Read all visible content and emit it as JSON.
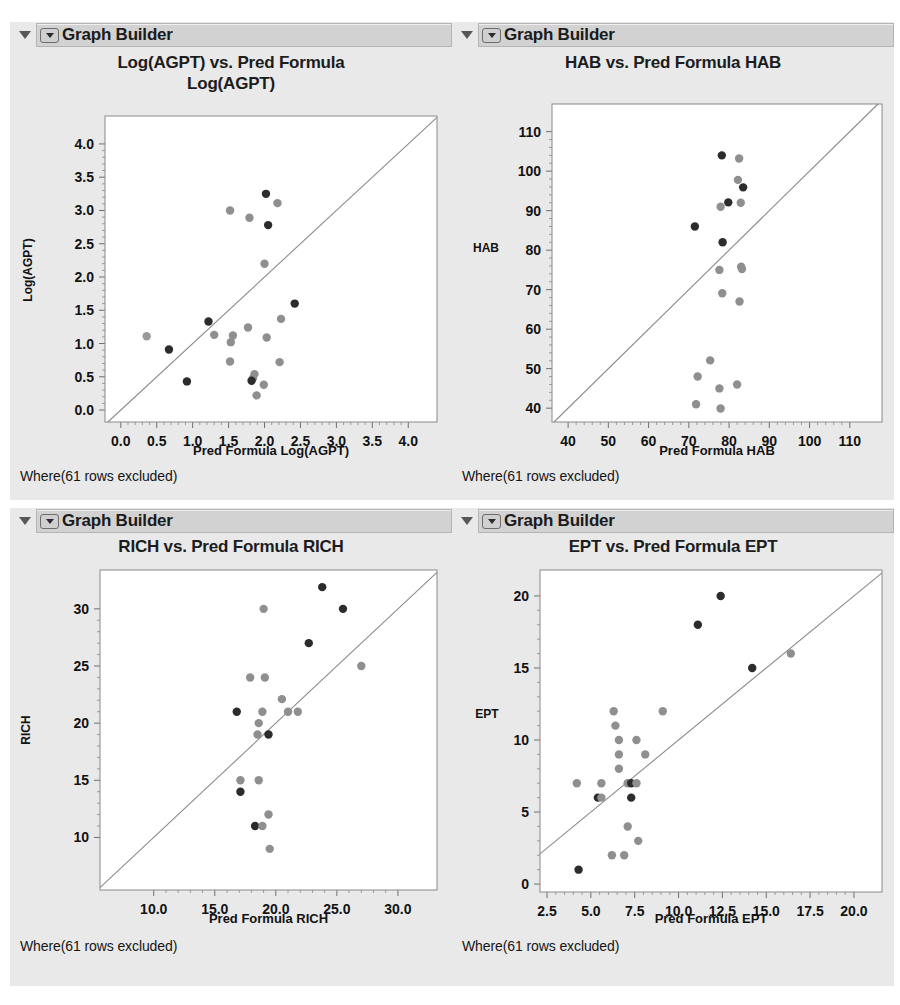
{
  "window": {
    "background": "#ffffff",
    "panel_background": "#e9e9e9",
    "title_bar_background": "#d2d2d2"
  },
  "panels": [
    {
      "id": "agpt",
      "node_title": "Graph Builder",
      "disclosure_icon": "triangle-down-icon",
      "popup_icon": "popup-menu-icon",
      "footer": "Where(61 rows excluded)",
      "chart_title_lines": [
        "Log(AGPT) vs. Pred Formula",
        "Log(AGPT)"
      ]
    },
    {
      "id": "hab",
      "node_title": "Graph Builder",
      "disclosure_icon": "triangle-down-icon",
      "popup_icon": "popup-menu-icon",
      "footer": "Where(61 rows excluded)",
      "chart_title_lines": [
        "HAB vs. Pred Formula HAB"
      ]
    },
    {
      "id": "rich",
      "node_title": "Graph Builder",
      "disclosure_icon": "triangle-down-icon",
      "popup_icon": "popup-menu-icon",
      "footer": "Where(61 rows excluded)",
      "chart_title_lines": [
        "RICH vs. Pred Formula RICH"
      ]
    },
    {
      "id": "ept",
      "node_title": "Graph Builder",
      "disclosure_icon": "triangle-down-icon",
      "popup_icon": "popup-menu-icon",
      "footer": "Where(61 rows excluded)",
      "chart_title_lines": [
        "EPT vs. Pred Formula EPT"
      ]
    }
  ],
  "chart_data": [
    {
      "id": "agpt",
      "type": "scatter",
      "title": "Log(AGPT) vs. Pred Formula Log(AGPT)",
      "xlabel": "Pred Formula Log(AGPT)",
      "ylabel": "Log(AGPT)",
      "xlim": [
        -0.22,
        4.4
      ],
      "ylim": [
        -0.18,
        4.42
      ],
      "xticks": [
        0.0,
        0.5,
        1.0,
        1.5,
        2.0,
        2.5,
        3.0,
        3.5,
        4.0
      ],
      "xticklabels": [
        "0.0",
        "0.5",
        "1.0",
        "1.5",
        "2.0",
        "2.5",
        "3.0",
        "3.5",
        "4.0"
      ],
      "yticks": [
        0.0,
        0.5,
        1.0,
        1.5,
        2.0,
        2.5,
        3.0,
        3.5,
        4.0
      ],
      "yticklabels": [
        "0.0",
        "0.5",
        "1.0",
        "1.5",
        "2.0",
        "2.5",
        "3.0",
        "3.5",
        "4.0"
      ],
      "grid": false,
      "legend": "none",
      "identity_line": true,
      "points": [
        {
          "x": 1.52,
          "y": 3.0,
          "c": "#8f8f8f"
        },
        {
          "x": 1.79,
          "y": 2.89,
          "c": "#8f8f8f"
        },
        {
          "x": 2.02,
          "y": 3.25,
          "c": "#2c2c2c"
        },
        {
          "x": 2.18,
          "y": 3.11,
          "c": "#8f8f8f"
        },
        {
          "x": 2.05,
          "y": 2.78,
          "c": "#2c2c2c"
        },
        {
          "x": 2.0,
          "y": 2.2,
          "c": "#8f8f8f"
        },
        {
          "x": 2.42,
          "y": 1.6,
          "c": "#2c2c2c"
        },
        {
          "x": 2.23,
          "y": 1.37,
          "c": "#8f8f8f"
        },
        {
          "x": 1.22,
          "y": 1.33,
          "c": "#2c2c2c"
        },
        {
          "x": 1.77,
          "y": 1.24,
          "c": "#8f8f8f"
        },
        {
          "x": 0.36,
          "y": 1.11,
          "c": "#9a9a9a"
        },
        {
          "x": 1.3,
          "y": 1.13,
          "c": "#8f8f8f"
        },
        {
          "x": 1.56,
          "y": 1.12,
          "c": "#8f8f8f"
        },
        {
          "x": 2.03,
          "y": 1.09,
          "c": "#8f8f8f"
        },
        {
          "x": 1.53,
          "y": 1.02,
          "c": "#8f8f8f"
        },
        {
          "x": 0.67,
          "y": 0.91,
          "c": "#2c2c2c"
        },
        {
          "x": 1.52,
          "y": 0.73,
          "c": "#8f8f8f"
        },
        {
          "x": 2.21,
          "y": 0.72,
          "c": "#8f8f8f"
        },
        {
          "x": 1.86,
          "y": 0.54,
          "c": "#8f8f8f"
        },
        {
          "x": 1.84,
          "y": 0.48,
          "c": "#8f8f8f"
        },
        {
          "x": 1.82,
          "y": 0.44,
          "c": "#2c2c2c"
        },
        {
          "x": 0.92,
          "y": 0.43,
          "c": "#2c2c2c"
        },
        {
          "x": 1.99,
          "y": 0.38,
          "c": "#8f8f8f"
        },
        {
          "x": 1.89,
          "y": 0.22,
          "c": "#8f8f8f"
        }
      ]
    },
    {
      "id": "hab",
      "type": "scatter",
      "title": "HAB vs. Pred Formula HAB",
      "xlabel": "Pred Formula HAB",
      "ylabel": "HAB",
      "xlim": [
        36.0,
        118.0
      ],
      "ylim": [
        36.5,
        117.0
      ],
      "xticks": [
        40,
        50,
        60,
        70,
        80,
        90,
        100,
        110
      ],
      "xticklabels": [
        "40",
        "50",
        "60",
        "70",
        "80",
        "90",
        "100",
        "110"
      ],
      "yticks": [
        40,
        50,
        60,
        70,
        80,
        90,
        100,
        110
      ],
      "yticklabels": [
        "40",
        "50",
        "60",
        "70",
        "80",
        "90",
        "100",
        "110"
      ],
      "grid": false,
      "legend": "none",
      "identity_line": true,
      "points": [
        {
          "x": 78.2,
          "y": 104.0,
          "c": "#2c2c2c"
        },
        {
          "x": 82.5,
          "y": 103.2,
          "c": "#8f8f8f"
        },
        {
          "x": 82.2,
          "y": 97.8,
          "c": "#8f8f8f"
        },
        {
          "x": 83.5,
          "y": 95.9,
          "c": "#2c2c2c"
        },
        {
          "x": 79.8,
          "y": 92.1,
          "c": "#2c2c2c"
        },
        {
          "x": 82.9,
          "y": 92.0,
          "c": "#8f8f8f"
        },
        {
          "x": 77.9,
          "y": 91.0,
          "c": "#8f8f8f"
        },
        {
          "x": 71.5,
          "y": 86.0,
          "c": "#2c2c2c"
        },
        {
          "x": 78.4,
          "y": 82.0,
          "c": "#2c2c2c"
        },
        {
          "x": 83.0,
          "y": 75.8,
          "c": "#8f8f8f"
        },
        {
          "x": 83.2,
          "y": 75.2,
          "c": "#8f8f8f"
        },
        {
          "x": 77.6,
          "y": 75.0,
          "c": "#8f8f8f"
        },
        {
          "x": 78.3,
          "y": 69.1,
          "c": "#8f8f8f"
        },
        {
          "x": 82.6,
          "y": 67.0,
          "c": "#8f8f8f"
        },
        {
          "x": 75.3,
          "y": 52.1,
          "c": "#8f8f8f"
        },
        {
          "x": 72.2,
          "y": 48.0,
          "c": "#8f8f8f"
        },
        {
          "x": 82.0,
          "y": 46.0,
          "c": "#8f8f8f"
        },
        {
          "x": 77.6,
          "y": 45.0,
          "c": "#8f8f8f"
        },
        {
          "x": 71.8,
          "y": 41.0,
          "c": "#8f8f8f"
        },
        {
          "x": 77.9,
          "y": 39.9,
          "c": "#8f8f8f"
        }
      ]
    },
    {
      "id": "rich",
      "type": "scatter",
      "title": "RICH vs. Pred Formula RICH",
      "xlabel": "Pred Formula RICH",
      "ylabel": "RICH",
      "xlim": [
        5.6,
        33.2
      ],
      "ylim": [
        5.4,
        33.4
      ],
      "xticks": [
        10.0,
        15.0,
        20.0,
        25.0,
        30.0
      ],
      "xticklabels": [
        "10.0",
        "15.0",
        "20.0",
        "25.0",
        "30.0"
      ],
      "yticks": [
        10,
        15,
        20,
        25,
        30
      ],
      "yticklabels": [
        "10",
        "15",
        "20",
        "25",
        "30"
      ],
      "grid": false,
      "legend": "none",
      "identity_line": true,
      "points": [
        {
          "x": 23.8,
          "y": 31.9,
          "c": "#2c2c2c"
        },
        {
          "x": 19.0,
          "y": 30.0,
          "c": "#8f8f8f"
        },
        {
          "x": 25.5,
          "y": 30.0,
          "c": "#2c2c2c"
        },
        {
          "x": 22.7,
          "y": 27.0,
          "c": "#2c2c2c"
        },
        {
          "x": 27.0,
          "y": 25.0,
          "c": "#8f8f8f"
        },
        {
          "x": 17.9,
          "y": 24.0,
          "c": "#8f8f8f"
        },
        {
          "x": 19.1,
          "y": 24.0,
          "c": "#8f8f8f"
        },
        {
          "x": 20.5,
          "y": 22.1,
          "c": "#8f8f8f"
        },
        {
          "x": 16.8,
          "y": 21.0,
          "c": "#2c2c2c"
        },
        {
          "x": 18.9,
          "y": 21.0,
          "c": "#8f8f8f"
        },
        {
          "x": 21.0,
          "y": 21.0,
          "c": "#8f8f8f"
        },
        {
          "x": 21.8,
          "y": 21.0,
          "c": "#8f8f8f"
        },
        {
          "x": 18.6,
          "y": 20.0,
          "c": "#8f8f8f"
        },
        {
          "x": 18.5,
          "y": 19.0,
          "c": "#8f8f8f"
        },
        {
          "x": 19.4,
          "y": 19.0,
          "c": "#2c2c2c"
        },
        {
          "x": 17.1,
          "y": 15.0,
          "c": "#8f8f8f"
        },
        {
          "x": 18.6,
          "y": 15.0,
          "c": "#8f8f8f"
        },
        {
          "x": 17.1,
          "y": 14.0,
          "c": "#2c2c2c"
        },
        {
          "x": 19.4,
          "y": 12.0,
          "c": "#8f8f8f"
        },
        {
          "x": 18.3,
          "y": 11.0,
          "c": "#2c2c2c"
        },
        {
          "x": 18.9,
          "y": 11.0,
          "c": "#8f8f8f"
        },
        {
          "x": 19.5,
          "y": 9.0,
          "c": "#8f8f8f"
        }
      ]
    },
    {
      "id": "ept",
      "type": "scatter",
      "title": "EPT vs. Pred Formula EPT",
      "xlabel": "Pred Formula EPT",
      "ylabel": "EPT",
      "xlim": [
        2.1,
        21.6
      ],
      "ylim": [
        -0.55,
        21.8
      ],
      "xticks": [
        2.5,
        5.0,
        7.5,
        10.0,
        12.5,
        15.0,
        17.5,
        20.0
      ],
      "xticklabels": [
        "2.5",
        "5.0",
        "7.5",
        "10.0",
        "12.5",
        "15.0",
        "17.5",
        "20.0"
      ],
      "yticks": [
        0,
        5,
        10,
        15,
        20
      ],
      "yticklabels": [
        "0",
        "5",
        "10",
        "15",
        "20"
      ],
      "grid": false,
      "legend": "none",
      "identity_line": true,
      "points": [
        {
          "x": 12.4,
          "y": 20.0,
          "c": "#2c2c2c"
        },
        {
          "x": 11.1,
          "y": 18.0,
          "c": "#2c2c2c"
        },
        {
          "x": 16.4,
          "y": 16.0,
          "c": "#8f8f8f"
        },
        {
          "x": 14.2,
          "y": 15.0,
          "c": "#2c2c2c"
        },
        {
          "x": 6.3,
          "y": 12.0,
          "c": "#8f8f8f"
        },
        {
          "x": 9.1,
          "y": 12.0,
          "c": "#8f8f8f"
        },
        {
          "x": 6.4,
          "y": 11.0,
          "c": "#8f8f8f"
        },
        {
          "x": 6.6,
          "y": 10.0,
          "c": "#8f8f8f"
        },
        {
          "x": 7.6,
          "y": 10.0,
          "c": "#8f8f8f"
        },
        {
          "x": 6.6,
          "y": 9.0,
          "c": "#8f8f8f"
        },
        {
          "x": 8.1,
          "y": 9.0,
          "c": "#8f8f8f"
        },
        {
          "x": 6.6,
          "y": 8.0,
          "c": "#8f8f8f"
        },
        {
          "x": 4.2,
          "y": 7.0,
          "c": "#8f8f8f"
        },
        {
          "x": 5.6,
          "y": 7.0,
          "c": "#8f8f8f"
        },
        {
          "x": 7.1,
          "y": 7.0,
          "c": "#8f8f8f"
        },
        {
          "x": 7.3,
          "y": 7.0,
          "c": "#2c2c2c"
        },
        {
          "x": 7.6,
          "y": 7.0,
          "c": "#8f8f8f"
        },
        {
          "x": 5.4,
          "y": 6.0,
          "c": "#2c2c2c"
        },
        {
          "x": 5.6,
          "y": 6.0,
          "c": "#8f8f8f"
        },
        {
          "x": 7.3,
          "y": 6.0,
          "c": "#2c2c2c"
        },
        {
          "x": 7.1,
          "y": 4.0,
          "c": "#8f8f8f"
        },
        {
          "x": 7.7,
          "y": 3.0,
          "c": "#8f8f8f"
        },
        {
          "x": 6.2,
          "y": 2.0,
          "c": "#8f8f8f"
        },
        {
          "x": 6.9,
          "y": 2.0,
          "c": "#8f8f8f"
        },
        {
          "x": 4.3,
          "y": 1.0,
          "c": "#2c2c2c"
        }
      ]
    }
  ]
}
